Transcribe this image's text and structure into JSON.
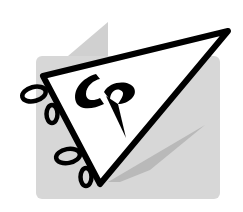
{
  "logo": {
    "name": "pennant-logo",
    "monogram": "CP",
    "colors": {
      "background": "#ffffff",
      "panel": "#d6d6d6",
      "panel_back": "#cfcfcf",
      "shadow": "#bdbdbd",
      "ink": "#000000",
      "pennant_fill": "#ffffff"
    }
  }
}
